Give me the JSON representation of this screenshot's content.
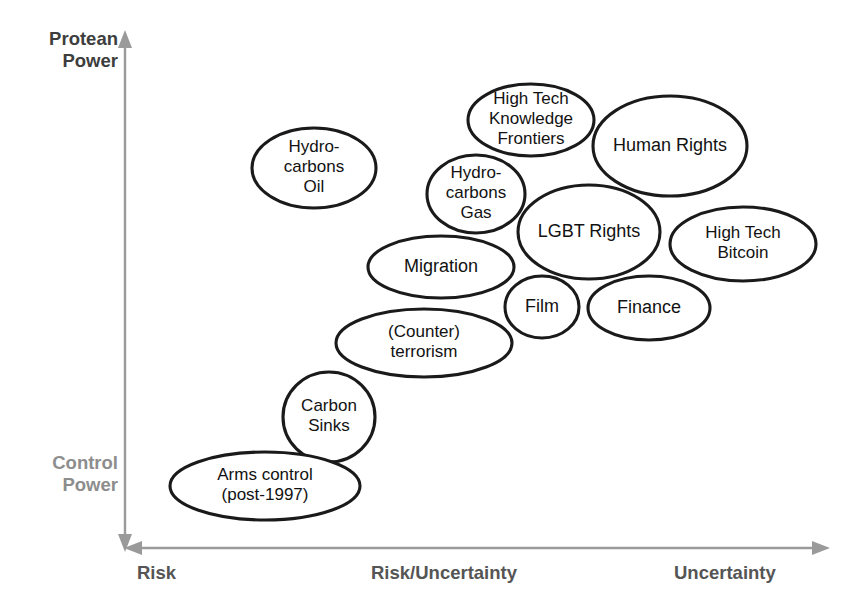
{
  "figure": {
    "background_color": "#ffffff",
    "bubble_stroke_color": "#1a1a1a",
    "bubble_fill_color": "#ffffff",
    "axis_color": "#9a9a9a",
    "axis_label_color": "#555555"
  },
  "axes": {
    "y": {
      "top_label": "Protean\nPower",
      "bottom_label": "Control\nPower",
      "arrow_direction": "up"
    },
    "x": {
      "arrow_direction": "both",
      "ticks": [
        {
          "label": "Risk"
        },
        {
          "label": "Risk/Uncertainty"
        },
        {
          "label": "Uncertainty"
        }
      ]
    }
  },
  "chart_data": {
    "type": "scatter",
    "title": "",
    "xlabel": "Risk — Risk/Uncertainty — Uncertainty",
    "ylabel": "Control Power — Protean Power",
    "grid": false,
    "legend": "none",
    "bubbles": [
      {
        "id": "hydrocarbons-oil",
        "lines": [
          "Hydro-",
          "carbons",
          "Oil"
        ],
        "cx": 314,
        "cy": 168,
        "rx": 62,
        "ry": 40,
        "rotate": 0,
        "font_size": 17
      },
      {
        "id": "high-tech-knowledge-frontiers",
        "lines": [
          "High Tech",
          "Knowledge",
          "Frontiers"
        ],
        "cx": 531,
        "cy": 120,
        "rx": 63,
        "ry": 36,
        "rotate": 0,
        "font_size": 17
      },
      {
        "id": "human-rights",
        "lines": [
          "Human Rights"
        ],
        "cx": 670,
        "cy": 146,
        "rx": 77,
        "ry": 50,
        "rotate": 0,
        "font_size": 18
      },
      {
        "id": "hydrocarbons-gas",
        "lines": [
          "Hydro-",
          "carbons",
          "Gas"
        ],
        "cx": 476,
        "cy": 194,
        "rx": 49,
        "ry": 39,
        "rotate": 0,
        "font_size": 17
      },
      {
        "id": "lgbt-rights",
        "lines": [
          "LGBT Rights"
        ],
        "cx": 589,
        "cy": 232,
        "rx": 71,
        "ry": 47,
        "rotate": 0,
        "font_size": 18
      },
      {
        "id": "high-tech-bitcoin",
        "lines": [
          "High Tech",
          "Bitcoin"
        ],
        "cx": 743,
        "cy": 244,
        "rx": 73,
        "ry": 37,
        "rotate": 0,
        "font_size": 17
      },
      {
        "id": "migration",
        "lines": [
          "Migration"
        ],
        "cx": 441,
        "cy": 267,
        "rx": 73,
        "ry": 31,
        "rotate": 0,
        "font_size": 18
      },
      {
        "id": "film",
        "lines": [
          "Film"
        ],
        "cx": 542,
        "cy": 307,
        "rx": 37,
        "ry": 31,
        "rotate": 0,
        "font_size": 18
      },
      {
        "id": "finance",
        "lines": [
          "Finance"
        ],
        "cx": 649,
        "cy": 308,
        "rx": 61,
        "ry": 32,
        "rotate": 0,
        "font_size": 18
      },
      {
        "id": "counter-terrorism",
        "lines": [
          "(Counter)",
          "terrorism"
        ],
        "cx": 424,
        "cy": 343,
        "rx": 88,
        "ry": 34,
        "rotate": 0,
        "font_size": 17
      },
      {
        "id": "carbon-sinks",
        "lines": [
          "Carbon",
          "Sinks"
        ],
        "cx": 329,
        "cy": 417,
        "rx": 46,
        "ry": 45,
        "rotate": 0,
        "font_size": 17
      },
      {
        "id": "arms-control",
        "lines": [
          "Arms control",
          "(post-1997)"
        ],
        "cx": 265,
        "cy": 486,
        "rx": 95,
        "ry": 34,
        "rotate": 0,
        "font_size": 17
      }
    ]
  }
}
